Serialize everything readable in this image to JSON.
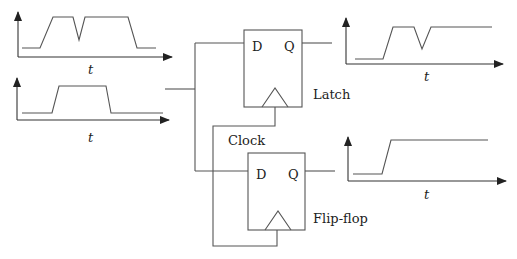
{
  "diagram": {
    "colors": {
      "line": "#555555",
      "axis": "#333333",
      "text": "#222222",
      "background": "#ffffff"
    },
    "input_plots": [
      {
        "name": "input-signal-glitchy",
        "axis_label": "t",
        "origin": [
          18,
          57
        ],
        "y_top": 12,
        "x_end": 172,
        "label_pos": [
          88,
          74
        ],
        "points": [
          [
            22,
            48
          ],
          [
            40,
            48
          ],
          [
            53,
            17
          ],
          [
            73,
            17
          ],
          [
            79,
            40
          ],
          [
            85,
            17
          ],
          [
            128,
            17
          ],
          [
            137,
            48
          ],
          [
            156,
            48
          ]
        ]
      },
      {
        "name": "input-signal-clean",
        "axis_label": "t",
        "origin": [
          17,
          120
        ],
        "y_top": 78,
        "x_end": 169,
        "label_pos": [
          88,
          142
        ],
        "points": [
          [
            22,
            113
          ],
          [
            52,
            113
          ],
          [
            59,
            86
          ],
          [
            106,
            86
          ],
          [
            111,
            113
          ],
          [
            163,
            113
          ]
        ]
      }
    ],
    "output_plots": [
      {
        "name": "latch-output-signal",
        "axis_label": "t",
        "origin": [
          346,
          64
        ],
        "y_top": 18,
        "x_end": 503,
        "label_pos": [
          424,
          81
        ],
        "points": [
          [
            355,
            59
          ],
          [
            383,
            59
          ],
          [
            393,
            27
          ],
          [
            414,
            27
          ],
          [
            422,
            49
          ],
          [
            431,
            27
          ],
          [
            492,
            27
          ]
        ]
      },
      {
        "name": "flipflop-output-signal",
        "axis_label": "t",
        "origin": [
          348,
          181
        ],
        "y_top": 137,
        "x_end": 506,
        "label_pos": [
          424,
          199
        ],
        "points": [
          [
            353,
            174
          ],
          [
            382,
            174
          ],
          [
            391,
            140
          ],
          [
            488,
            140
          ]
        ]
      }
    ],
    "latch": {
      "label": "Latch",
      "d_label": "D",
      "q_label": "Q"
    },
    "flipflop": {
      "label": "Flip-flop",
      "d_label": "D",
      "q_label": "Q"
    },
    "clock_label": "Clock"
  }
}
